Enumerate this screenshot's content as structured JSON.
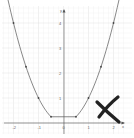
{
  "chart_data": {
    "type": "line",
    "title": "",
    "xlabel": "x",
    "ylabel": "y",
    "xlim": [
      -2.4,
      2.5
    ],
    "ylim": [
      -0.6,
      4.6
    ],
    "grid": true,
    "x_ticks": [
      -2,
      -1,
      0,
      1,
      2
    ],
    "y_ticks": [
      1,
      2,
      3,
      4
    ],
    "x_tick_labels": [
      "-2",
      "-1",
      "0",
      "1",
      "2"
    ],
    "y_tick_labels": [
      "1",
      "2",
      "3",
      "4"
    ],
    "series": [
      {
        "name": "curve",
        "color": "#555555",
        "description": "parabola y=x^2 with flat bottom segment between x=-0.5 and x=0.5 at y=0.25",
        "x": [
          -2.3,
          -2,
          -1.5,
          -1,
          -0.5,
          0.5,
          1,
          1.5,
          2,
          2.3
        ],
        "y": [
          5.29,
          4,
          2.25,
          1,
          0.25,
          0.25,
          1,
          2.25,
          4,
          5.29
        ]
      }
    ],
    "marked_points": [
      {
        "x": -2,
        "y": 4
      },
      {
        "x": -1.5,
        "y": 2.25
      },
      {
        "x": -1,
        "y": 1
      },
      {
        "x": -0.5,
        "y": 0.25
      },
      {
        "x": 0.5,
        "y": 0.25
      },
      {
        "x": 1,
        "y": 1
      },
      {
        "x": 1.5,
        "y": 2.25
      },
      {
        "x": 2,
        "y": 4
      }
    ],
    "annotations": [
      {
        "type": "cross-mark",
        "meaning": "incorrect",
        "color": "#222222",
        "position": "lower-right"
      }
    ]
  },
  "axis": {
    "x_name": "x",
    "y_name": "y",
    "origin_label": "0"
  }
}
